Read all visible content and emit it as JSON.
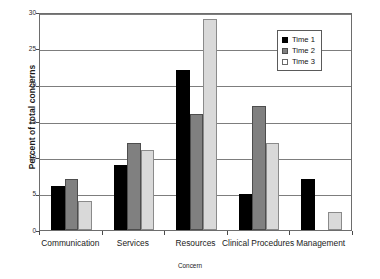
{
  "chart_data": {
    "type": "bar",
    "title": "",
    "xlabel": "Concern",
    "ylabel": "Percent of total concerns",
    "categories": [
      "Communication",
      "Services",
      "Resources",
      "Clinical Procedures",
      "Management"
    ],
    "series": [
      {
        "name": "Time 1",
        "color": "#000000",
        "values": [
          6,
          9,
          22,
          5,
          7
        ]
      },
      {
        "name": "Time 2",
        "color": "#808080",
        "values": [
          7,
          12,
          16,
          17,
          0
        ]
      },
      {
        "name": "Time 3",
        "color": "#d9d9d9",
        "values": [
          4,
          11,
          29,
          12,
          2.5
        ]
      }
    ],
    "ylim": [
      0,
      30
    ],
    "yticks": [
      0,
      5,
      10,
      15,
      20,
      25,
      30
    ],
    "ytick_labels": [
      "0",
      "5",
      "10",
      "15",
      "20",
      "25",
      "30"
    ],
    "grid": true,
    "legend_position": "top-right"
  },
  "legend": {
    "items": [
      {
        "label": "Time 1"
      },
      {
        "label": "Time 2"
      },
      {
        "label": "Time 3"
      }
    ]
  },
  "axes": {
    "x_title": "Concern",
    "y_title": "Percent of total concerns"
  }
}
